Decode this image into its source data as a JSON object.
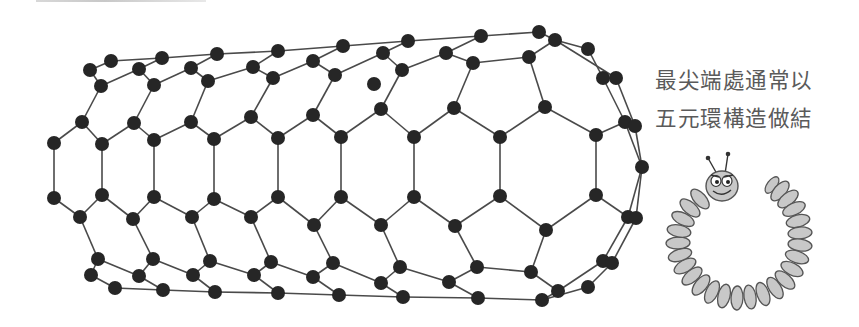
{
  "caption": {
    "line1": "最尖端處通常以",
    "line2": "五元環構造做結"
  },
  "colors": {
    "atom": "#262626",
    "bond": "#4a4a4a",
    "caption_text": "#5a5a5a",
    "worm_fill": "#c8c8c8",
    "worm_stroke": "#555555"
  },
  "nanotube": {
    "atom_radius": 7,
    "atoms": [
      [
        90,
        70
      ],
      [
        111,
        61
      ],
      [
        101,
        86
      ],
      [
        139,
        69
      ],
      [
        162,
        58
      ],
      [
        154,
        85
      ],
      [
        191,
        68
      ],
      [
        217,
        54
      ],
      [
        208,
        81
      ],
      [
        253,
        67
      ],
      [
        278,
        51
      ],
      [
        273,
        78
      ],
      [
        313,
        61
      ],
      [
        343,
        46
      ],
      [
        335,
        75
      ],
      [
        383,
        53
      ],
      [
        408,
        41
      ],
      [
        402,
        70
      ],
      [
        446,
        53
      ],
      [
        481,
        36
      ],
      [
        473,
        63
      ],
      [
        529,
        57
      ],
      [
        539,
        32
      ],
      [
        555,
        40
      ],
      [
        588,
        49
      ],
      [
        603,
        78
      ],
      [
        616,
        78
      ],
      [
        625,
        122
      ],
      [
        635,
        126
      ],
      [
        642,
        167
      ],
      [
        374,
        84
      ],
      [
        82,
        122
      ],
      [
        134,
        123
      ],
      [
        191,
        122
      ],
      [
        251,
        117
      ],
      [
        313,
        115
      ],
      [
        381,
        109
      ],
      [
        454,
        108
      ],
      [
        545,
        107
      ],
      [
        54,
        143
      ],
      [
        102,
        144
      ],
      [
        154,
        140
      ],
      [
        214,
        139
      ],
      [
        278,
        138
      ],
      [
        341,
        137
      ],
      [
        414,
        137
      ],
      [
        500,
        137
      ],
      [
        596,
        135
      ],
      [
        54,
        198
      ],
      [
        102,
        195
      ],
      [
        154,
        197
      ],
      [
        214,
        199
      ],
      [
        278,
        197
      ],
      [
        341,
        197
      ],
      [
        414,
        197
      ],
      [
        500,
        196
      ],
      [
        596,
        195
      ],
      [
        80,
        217
      ],
      [
        133,
        219
      ],
      [
        192,
        217
      ],
      [
        251,
        217
      ],
      [
        314,
        225
      ],
      [
        381,
        225
      ],
      [
        455,
        226
      ],
      [
        546,
        230
      ],
      [
        628,
        217
      ],
      [
        636,
        218
      ],
      [
        98,
        259
      ],
      [
        153,
        259
      ],
      [
        210,
        261
      ],
      [
        271,
        262
      ],
      [
        333,
        263
      ],
      [
        400,
        267
      ],
      [
        477,
        267
      ],
      [
        531,
        272
      ],
      [
        91,
        275
      ],
      [
        139,
        276
      ],
      [
        193,
        275
      ],
      [
        254,
        275
      ],
      [
        313,
        277
      ],
      [
        381,
        283
      ],
      [
        449,
        282
      ],
      [
        558,
        291
      ],
      [
        588,
        287
      ],
      [
        603,
        261
      ],
      [
        612,
        263
      ],
      [
        115,
        288
      ],
      [
        163,
        290
      ],
      [
        215,
        292
      ],
      [
        278,
        293
      ],
      [
        339,
        295
      ],
      [
        403,
        297
      ],
      [
        478,
        298
      ],
      [
        542,
        300
      ]
    ],
    "bonds": [
      [
        111,
        61,
        162,
        58
      ],
      [
        162,
        58,
        217,
        54
      ],
      [
        217,
        54,
        278,
        51
      ],
      [
        278,
        51,
        343,
        46
      ],
      [
        343,
        46,
        408,
        41
      ],
      [
        408,
        41,
        481,
        36
      ],
      [
        481,
        36,
        539,
        32
      ],
      [
        539,
        32,
        555,
        40
      ],
      [
        90,
        70,
        111,
        61
      ],
      [
        90,
        70,
        101,
        86
      ],
      [
        101,
        86,
        139,
        69
      ],
      [
        139,
        69,
        162,
        58
      ],
      [
        139,
        69,
        154,
        85
      ],
      [
        154,
        85,
        191,
        68
      ],
      [
        191,
        68,
        217,
        54
      ],
      [
        191,
        68,
        208,
        81
      ],
      [
        208,
        81,
        253,
        67
      ],
      [
        253,
        67,
        278,
        51
      ],
      [
        253,
        67,
        273,
        78
      ],
      [
        273,
        78,
        313,
        61
      ],
      [
        313,
        61,
        343,
        46
      ],
      [
        313,
        61,
        335,
        75
      ],
      [
        335,
        75,
        383,
        53
      ],
      [
        383,
        53,
        408,
        41
      ],
      [
        383,
        53,
        402,
        70
      ],
      [
        402,
        70,
        446,
        53
      ],
      [
        446,
        53,
        481,
        36
      ],
      [
        446,
        53,
        473,
        63
      ],
      [
        473,
        63,
        529,
        57
      ],
      [
        529,
        57,
        555,
        40
      ],
      [
        555,
        40,
        588,
        49
      ],
      [
        588,
        49,
        603,
        78
      ],
      [
        555,
        40,
        616,
        78
      ],
      [
        603,
        78,
        625,
        122
      ],
      [
        616,
        78,
        635,
        126
      ],
      [
        625,
        122,
        642,
        167
      ],
      [
        635,
        126,
        642,
        167
      ],
      [
        101,
        86,
        82,
        122
      ],
      [
        154,
        85,
        134,
        123
      ],
      [
        208,
        81,
        191,
        122
      ],
      [
        273,
        78,
        251,
        117
      ],
      [
        335,
        75,
        313,
        115
      ],
      [
        402,
        70,
        381,
        109
      ],
      [
        473,
        63,
        454,
        108
      ],
      [
        529,
        57,
        545,
        107
      ],
      [
        82,
        122,
        54,
        143
      ],
      [
        82,
        122,
        102,
        144
      ],
      [
        134,
        123,
        102,
        144
      ],
      [
        134,
        123,
        154,
        140
      ],
      [
        191,
        122,
        154,
        140
      ],
      [
        191,
        122,
        214,
        139
      ],
      [
        251,
        117,
        214,
        139
      ],
      [
        251,
        117,
        278,
        138
      ],
      [
        313,
        115,
        278,
        138
      ],
      [
        313,
        115,
        341,
        137
      ],
      [
        381,
        109,
        341,
        137
      ],
      [
        381,
        109,
        414,
        137
      ],
      [
        454,
        108,
        414,
        137
      ],
      [
        454,
        108,
        500,
        137
      ],
      [
        545,
        107,
        500,
        137
      ],
      [
        545,
        107,
        596,
        135
      ],
      [
        596,
        135,
        625,
        122
      ],
      [
        54,
        143,
        54,
        198
      ],
      [
        102,
        144,
        102,
        195
      ],
      [
        154,
        140,
        154,
        197
      ],
      [
        214,
        139,
        214,
        199
      ],
      [
        278,
        138,
        278,
        197
      ],
      [
        341,
        137,
        341,
        197
      ],
      [
        414,
        137,
        414,
        197
      ],
      [
        500,
        137,
        500,
        196
      ],
      [
        596,
        135,
        596,
        195
      ],
      [
        54,
        198,
        80,
        217
      ],
      [
        102,
        195,
        80,
        217
      ],
      [
        102,
        195,
        133,
        219
      ],
      [
        154,
        197,
        133,
        219
      ],
      [
        154,
        197,
        192,
        217
      ],
      [
        214,
        199,
        192,
        217
      ],
      [
        214,
        199,
        251,
        217
      ],
      [
        278,
        197,
        251,
        217
      ],
      [
        278,
        197,
        314,
        225
      ],
      [
        341,
        197,
        314,
        225
      ],
      [
        341,
        197,
        381,
        225
      ],
      [
        414,
        197,
        381,
        225
      ],
      [
        414,
        197,
        455,
        226
      ],
      [
        500,
        196,
        455,
        226
      ],
      [
        500,
        196,
        546,
        230
      ],
      [
        596,
        195,
        546,
        230
      ],
      [
        596,
        195,
        628,
        217
      ],
      [
        642,
        167,
        628,
        217
      ],
      [
        642,
        167,
        636,
        218
      ],
      [
        80,
        217,
        98,
        259
      ],
      [
        133,
        219,
        153,
        259
      ],
      [
        192,
        217,
        210,
        261
      ],
      [
        251,
        217,
        271,
        262
      ],
      [
        314,
        225,
        333,
        263
      ],
      [
        381,
        225,
        400,
        267
      ],
      [
        455,
        226,
        477,
        267
      ],
      [
        546,
        230,
        531,
        272
      ],
      [
        91,
        275,
        98,
        259
      ],
      [
        98,
        259,
        139,
        276
      ],
      [
        139,
        276,
        153,
        259
      ],
      [
        153,
        259,
        193,
        275
      ],
      [
        193,
        275,
        210,
        261
      ],
      [
        210,
        261,
        254,
        275
      ],
      [
        254,
        275,
        271,
        262
      ],
      [
        271,
        262,
        313,
        277
      ],
      [
        313,
        277,
        333,
        263
      ],
      [
        333,
        263,
        381,
        283
      ],
      [
        381,
        283,
        400,
        267
      ],
      [
        400,
        267,
        449,
        282
      ],
      [
        449,
        282,
        477,
        267
      ],
      [
        477,
        267,
        531,
        272
      ],
      [
        531,
        272,
        558,
        291
      ],
      [
        91,
        275,
        115,
        288
      ],
      [
        139,
        276,
        163,
        290
      ],
      [
        193,
        275,
        215,
        292
      ],
      [
        254,
        275,
        278,
        293
      ],
      [
        313,
        277,
        339,
        295
      ],
      [
        381,
        283,
        403,
        297
      ],
      [
        449,
        282,
        478,
        298
      ],
      [
        558,
        291,
        542,
        300
      ],
      [
        115,
        288,
        163,
        290
      ],
      [
        163,
        290,
        215,
        292
      ],
      [
        215,
        292,
        278,
        293
      ],
      [
        278,
        293,
        339,
        295
      ],
      [
        339,
        295,
        403,
        297
      ],
      [
        403,
        297,
        478,
        298
      ],
      [
        478,
        298,
        542,
        300
      ],
      [
        628,
        217,
        603,
        261
      ],
      [
        636,
        218,
        612,
        263
      ],
      [
        603,
        261,
        558,
        291
      ],
      [
        612,
        263,
        588,
        287
      ],
      [
        588,
        287,
        542,
        300
      ]
    ]
  },
  "worm": {
    "segments": [
      [
        700,
        199
      ],
      [
        690,
        208
      ],
      [
        683,
        219
      ],
      [
        679,
        231
      ],
      [
        678,
        243
      ],
      [
        680,
        255
      ],
      [
        685,
        266
      ],
      [
        692,
        276
      ],
      [
        701,
        285
      ],
      [
        712,
        292
      ],
      [
        724,
        296
      ],
      [
        737,
        298
      ],
      [
        750,
        297
      ],
      [
        763,
        294
      ],
      [
        775,
        288
      ],
      [
        785,
        280
      ],
      [
        792,
        269
      ],
      [
        797,
        257
      ],
      [
        800,
        245
      ],
      [
        800,
        233
      ],
      [
        798,
        221
      ],
      [
        794,
        209
      ],
      [
        788,
        199
      ],
      [
        780,
        191
      ],
      [
        772,
        185
      ]
    ],
    "head": {
      "cx": 722,
      "cy": 186,
      "rx": 16,
      "ry": 15
    }
  }
}
